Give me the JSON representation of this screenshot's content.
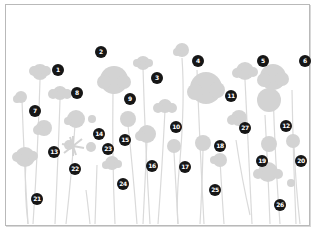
{
  "figure": {
    "type": "illustration-key",
    "colors": {
      "flower": "#d2d2d2",
      "stem": "#d9d9d9",
      "callout_bg": "#161616",
      "callout_text": "#ffffff",
      "frame": "#b9b9b9"
    },
    "callouts": [
      {
        "label": "1",
        "x": 58,
        "y": 70
      },
      {
        "label": "2",
        "x": 101,
        "y": 52
      },
      {
        "label": "3",
        "x": 157,
        "y": 78
      },
      {
        "label": "4",
        "x": 198,
        "y": 61
      },
      {
        "label": "5",
        "x": 263,
        "y": 61
      },
      {
        "label": "6",
        "x": 305,
        "y": 61
      },
      {
        "label": "7",
        "x": 35,
        "y": 111
      },
      {
        "label": "8",
        "x": 77,
        "y": 93
      },
      {
        "label": "9",
        "x": 130,
        "y": 99
      },
      {
        "label": "10",
        "x": 176,
        "y": 127
      },
      {
        "label": "11",
        "x": 231,
        "y": 96
      },
      {
        "label": "12",
        "x": 286,
        "y": 126
      },
      {
        "label": "13",
        "x": 54,
        "y": 152
      },
      {
        "label": "14",
        "x": 99,
        "y": 134
      },
      {
        "label": "15",
        "x": 125,
        "y": 140
      },
      {
        "label": "16",
        "x": 152,
        "y": 166
      },
      {
        "label": "17",
        "x": 185,
        "y": 167
      },
      {
        "label": "18",
        "x": 220,
        "y": 146
      },
      {
        "label": "19",
        "x": 262,
        "y": 161
      },
      {
        "label": "20",
        "x": 301,
        "y": 161
      },
      {
        "label": "21",
        "x": 37,
        "y": 199
      },
      {
        "label": "22",
        "x": 75,
        "y": 169
      },
      {
        "label": "23",
        "x": 108,
        "y": 149
      },
      {
        "label": "24",
        "x": 123,
        "y": 184
      },
      {
        "label": "25",
        "x": 215,
        "y": 190
      },
      {
        "label": "26",
        "x": 280,
        "y": 205
      },
      {
        "label": "27",
        "x": 245,
        "y": 128
      }
    ]
  }
}
